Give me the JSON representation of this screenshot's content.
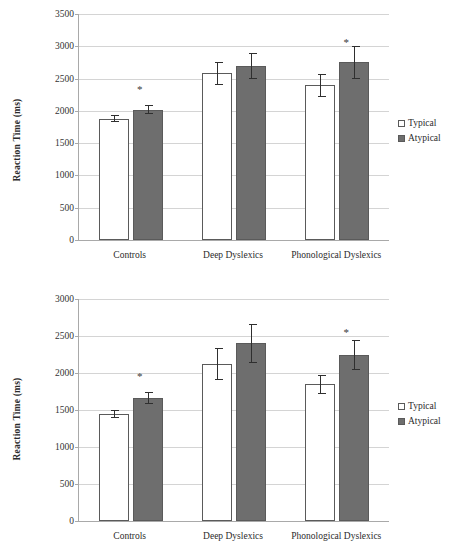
{
  "figure": {
    "legend_labels": [
      "Typical",
      "Atypical"
    ],
    "series_colors": {
      "Typical": "#ffffff",
      "Atypical": "#6e6e6e"
    },
    "significance_marker": "*"
  },
  "chart_data": [
    {
      "type": "bar",
      "panel": "top",
      "title": "",
      "xlabel": "",
      "ylabel": "Reaction Time (ms)",
      "ylim": [
        0,
        3500
      ],
      "ytick_step": 500,
      "yticks": [
        0,
        500,
        1000,
        1500,
        2000,
        2500,
        3000,
        3500
      ],
      "ytick_labels": [
        "0",
        "500",
        "1000",
        "1500",
        "2000",
        "2500",
        "3000",
        "3500"
      ],
      "grid": true,
      "legend_position": "right",
      "categories": [
        "Controls",
        "Deep Dyslexics",
        "Phonological Dyslexics"
      ],
      "series": [
        {
          "name": "Typical",
          "values": [
            1880,
            2580,
            2395
          ],
          "errors": [
            55,
            180,
            175
          ]
        },
        {
          "name": "Atypical",
          "values": [
            2020,
            2695,
            2755
          ],
          "errors": [
            75,
            195,
            255
          ]
        }
      ],
      "annotations": [
        {
          "category": "Controls",
          "series": "Atypical",
          "text": "*",
          "value": 2320
        },
        {
          "category": "Phonological Dyslexics",
          "series": "Atypical",
          "text": "*",
          "value": 3055
        }
      ]
    },
    {
      "type": "bar",
      "panel": "bottom",
      "title": "",
      "xlabel": "",
      "ylabel": "Reaction Time (ms)",
      "ylim": [
        0,
        3000
      ],
      "ytick_step": 500,
      "yticks": [
        0,
        500,
        1000,
        1500,
        2000,
        2500,
        3000
      ],
      "ytick_labels": [
        "0",
        "500",
        "1000",
        "1500",
        "2000",
        "2500",
        "3000"
      ],
      "grid": true,
      "legend_position": "right",
      "categories": [
        "Controls",
        "Deep Dyslexics",
        "Phonological Dyslexics"
      ],
      "series": [
        {
          "name": "Typical",
          "values": [
            1445,
            2120,
            1845
          ],
          "errors": [
            55,
            220,
            130
          ]
        },
        {
          "name": "Atypical",
          "values": [
            1665,
            2400,
            2240
          ],
          "errors": [
            85,
            265,
            205
          ]
        }
      ],
      "annotations": [
        {
          "category": "Controls",
          "series": "Atypical",
          "text": "*",
          "value": 1945
        },
        {
          "category": "Phonological Dyslexics",
          "series": "Atypical",
          "text": "*",
          "value": 2545
        }
      ]
    }
  ]
}
